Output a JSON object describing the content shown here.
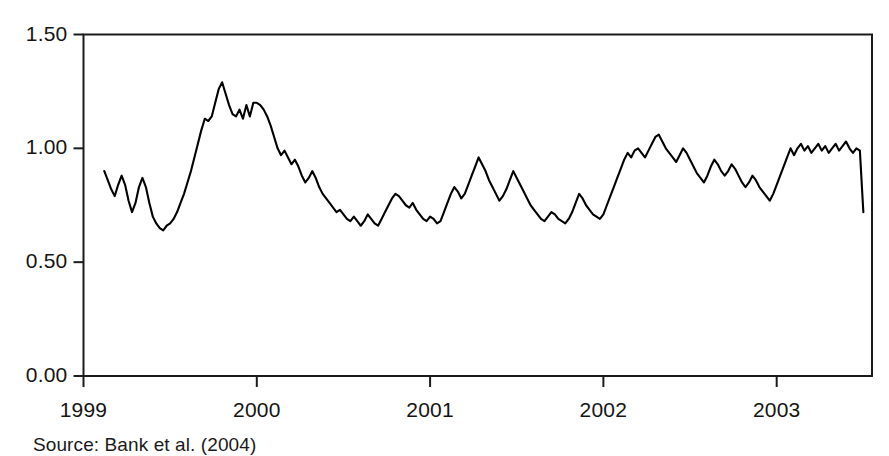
{
  "figure": {
    "source_note": "Source: Bank et al. (2004)"
  },
  "chart_data": {
    "type": "line",
    "title": "",
    "subtitle": "",
    "xlabel": "",
    "ylabel": "",
    "xlim": [
      1999.0,
      2003.55
    ],
    "ylim": [
      0.0,
      1.5
    ],
    "grid": false,
    "legend": null,
    "x_tick_labels": [
      "1999",
      "2000",
      "2001",
      "2002",
      "2003"
    ],
    "x_tick_values": [
      1999,
      2000,
      2001,
      2002,
      2003
    ],
    "y_tick_labels": [
      "0.00",
      "0.50",
      "1.00",
      "1.50"
    ],
    "y_tick_values": [
      0.0,
      0.5,
      1.0,
      1.5
    ],
    "line_color": "#000000",
    "line_width": 2.1,
    "series": [
      {
        "name": "series-1",
        "x": [
          1999.12,
          1999.14,
          1999.16,
          1999.18,
          1999.2,
          1999.22,
          1999.24,
          1999.26,
          1999.28,
          1999.3,
          1999.32,
          1999.34,
          1999.36,
          1999.38,
          1999.4,
          1999.42,
          1999.44,
          1999.46,
          1999.48,
          1999.5,
          1999.52,
          1999.54,
          1999.56,
          1999.58,
          1999.6,
          1999.62,
          1999.64,
          1999.66,
          1999.68,
          1999.7,
          1999.72,
          1999.74,
          1999.76,
          1999.78,
          1999.8,
          1999.82,
          1999.84,
          1999.86,
          1999.88,
          1999.9,
          1999.92,
          1999.94,
          1999.96,
          1999.98,
          2000.0,
          2000.02,
          2000.04,
          2000.06,
          2000.08,
          2000.1,
          2000.12,
          2000.14,
          2000.16,
          2000.18,
          2000.2,
          2000.22,
          2000.24,
          2000.26,
          2000.28,
          2000.3,
          2000.32,
          2000.34,
          2000.36,
          2000.38,
          2000.4,
          2000.42,
          2000.44,
          2000.46,
          2000.48,
          2000.5,
          2000.52,
          2000.54,
          2000.56,
          2000.58,
          2000.6,
          2000.62,
          2000.64,
          2000.66,
          2000.68,
          2000.7,
          2000.72,
          2000.74,
          2000.76,
          2000.78,
          2000.8,
          2000.82,
          2000.84,
          2000.86,
          2000.88,
          2000.9,
          2000.92,
          2000.94,
          2000.96,
          2000.98,
          2001.0,
          2001.02,
          2001.04,
          2001.06,
          2001.08,
          2001.1,
          2001.12,
          2001.14,
          2001.16,
          2001.18,
          2001.2,
          2001.22,
          2001.24,
          2001.26,
          2001.28,
          2001.3,
          2001.32,
          2001.34,
          2001.36,
          2001.38,
          2001.4,
          2001.42,
          2001.44,
          2001.46,
          2001.48,
          2001.5,
          2001.52,
          2001.54,
          2001.56,
          2001.58,
          2001.6,
          2001.62,
          2001.64,
          2001.66,
          2001.68,
          2001.7,
          2001.72,
          2001.74,
          2001.76,
          2001.78,
          2001.8,
          2001.82,
          2001.84,
          2001.86,
          2001.88,
          2001.9,
          2001.92,
          2001.94,
          2001.96,
          2001.98,
          2002.0,
          2002.02,
          2002.04,
          2002.06,
          2002.08,
          2002.1,
          2002.12,
          2002.14,
          2002.16,
          2002.18,
          2002.2,
          2002.22,
          2002.24,
          2002.26,
          2002.28,
          2002.3,
          2002.32,
          2002.34,
          2002.36,
          2002.38,
          2002.4,
          2002.42,
          2002.44,
          2002.46,
          2002.48,
          2002.5,
          2002.52,
          2002.54,
          2002.56,
          2002.58,
          2002.6,
          2002.62,
          2002.64,
          2002.66,
          2002.68,
          2002.7,
          2002.72,
          2002.74,
          2002.76,
          2002.78,
          2002.8,
          2002.82,
          2002.84,
          2002.86,
          2002.88,
          2002.9,
          2002.92,
          2002.94,
          2002.96,
          2002.98,
          2003.0,
          2003.02,
          2003.04,
          2003.06,
          2003.08,
          2003.1,
          2003.12,
          2003.14,
          2003.16,
          2003.18,
          2003.2,
          2003.22,
          2003.24,
          2003.26,
          2003.28,
          2003.3,
          2003.32,
          2003.34,
          2003.36,
          2003.38,
          2003.4,
          2003.42,
          2003.44,
          2003.46,
          2003.48,
          2003.5
        ],
        "y": [
          0.9,
          0.86,
          0.82,
          0.79,
          0.84,
          0.88,
          0.84,
          0.77,
          0.72,
          0.76,
          0.83,
          0.87,
          0.83,
          0.76,
          0.7,
          0.67,
          0.65,
          0.64,
          0.66,
          0.67,
          0.69,
          0.72,
          0.76,
          0.8,
          0.85,
          0.9,
          0.96,
          1.02,
          1.08,
          1.13,
          1.12,
          1.14,
          1.2,
          1.26,
          1.29,
          1.24,
          1.19,
          1.15,
          1.14,
          1.17,
          1.13,
          1.19,
          1.14,
          1.2,
          1.2,
          1.19,
          1.17,
          1.14,
          1.1,
          1.05,
          1.0,
          0.97,
          0.99,
          0.96,
          0.93,
          0.95,
          0.92,
          0.88,
          0.85,
          0.87,
          0.9,
          0.87,
          0.83,
          0.8,
          0.78,
          0.76,
          0.74,
          0.72,
          0.73,
          0.71,
          0.69,
          0.68,
          0.7,
          0.68,
          0.66,
          0.68,
          0.71,
          0.69,
          0.67,
          0.66,
          0.69,
          0.72,
          0.75,
          0.78,
          0.8,
          0.79,
          0.77,
          0.75,
          0.74,
          0.76,
          0.73,
          0.71,
          0.69,
          0.68,
          0.7,
          0.69,
          0.67,
          0.68,
          0.72,
          0.76,
          0.8,
          0.83,
          0.81,
          0.78,
          0.8,
          0.84,
          0.88,
          0.92,
          0.96,
          0.93,
          0.9,
          0.86,
          0.83,
          0.8,
          0.77,
          0.79,
          0.82,
          0.86,
          0.9,
          0.87,
          0.84,
          0.81,
          0.78,
          0.75,
          0.73,
          0.71,
          0.69,
          0.68,
          0.7,
          0.72,
          0.71,
          0.69,
          0.68,
          0.67,
          0.69,
          0.72,
          0.76,
          0.8,
          0.78,
          0.75,
          0.73,
          0.71,
          0.7,
          0.69,
          0.71,
          0.75,
          0.79,
          0.83,
          0.87,
          0.91,
          0.95,
          0.98,
          0.96,
          0.99,
          1.0,
          0.98,
          0.96,
          0.99,
          1.02,
          1.05,
          1.06,
          1.03,
          1.0,
          0.98,
          0.96,
          0.94,
          0.97,
          1.0,
          0.98,
          0.95,
          0.92,
          0.89,
          0.87,
          0.85,
          0.88,
          0.92,
          0.95,
          0.93,
          0.9,
          0.88,
          0.9,
          0.93,
          0.91,
          0.88,
          0.85,
          0.83,
          0.85,
          0.88,
          0.86,
          0.83,
          0.81,
          0.79,
          0.77,
          0.8,
          0.84,
          0.88,
          0.92,
          0.96,
          1.0,
          0.97,
          1.0,
          1.02,
          0.99,
          1.01,
          0.98,
          1.0,
          1.02,
          0.99,
          1.01,
          0.98,
          1.0,
          1.02,
          0.99,
          1.01,
          1.03,
          1.0,
          0.98,
          1.0,
          0.99,
          0.72
        ]
      }
    ],
    "annotations": [
      {
        "label": "1999 peak",
        "x": 1999.8,
        "y": 1.29
      },
      {
        "label": "2000 trough",
        "x": 2000.64,
        "y": 0.64
      },
      {
        "label": "mid-2001 peak",
        "x": 2001.62,
        "y": 1.06
      },
      {
        "label": "2002 spike",
        "x": 2002.24,
        "y": 1.2
      },
      {
        "label": "2002 peak",
        "x": 2002.56,
        "y": 1.24
      },
      {
        "label": "2003 trough",
        "x": 2003.18,
        "y": 0.57
      },
      {
        "label": "series end",
        "x": 2003.5,
        "y": 0.72
      }
    ]
  }
}
